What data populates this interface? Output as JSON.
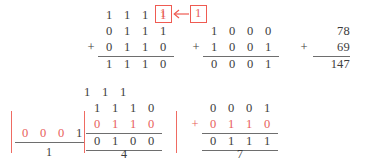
{
  "figure": {
    "colors": {
      "ink": "#3c3c3c",
      "accent_red": "#e8605a",
      "box_red": "#ef5b52",
      "rule": "#6e6e6e"
    }
  },
  "top": {
    "binary_left": {
      "carry_row": [
        "1",
        "1",
        "1",
        "1"
      ],
      "addend_top": [
        "0",
        "1",
        "1",
        "1"
      ],
      "addend_bottom": [
        "0",
        "1",
        "1",
        "0"
      ],
      "plus_sign": "+",
      "sum": [
        "1",
        "1",
        "1",
        "0"
      ]
    },
    "carry_out_box": "1",
    "carry_in_box": "1",
    "arrow": "←",
    "binary_right": {
      "addend_top": [
        "1",
        "0",
        "0",
        "0"
      ],
      "addend_bottom": [
        "1",
        "0",
        "0",
        "1"
      ],
      "plus_sign": "+",
      "sum": [
        "0",
        "0",
        "0",
        "1"
      ]
    },
    "decimal": {
      "addend_top": "78",
      "addend_bottom": "69",
      "plus_sign": "+",
      "sum": "147"
    }
  },
  "bottom": {
    "panel_left": {
      "digits": [
        "0",
        "0",
        "0",
        "1"
      ],
      "digit_colors": [
        "red",
        "red",
        "red",
        "black"
      ],
      "caption": "1"
    },
    "panel_middle": {
      "carry_row": [
        "1",
        "1",
        "1"
      ],
      "addend_top": [
        "1",
        "1",
        "1",
        "0"
      ],
      "addend_bottom": [
        "0",
        "1",
        "1",
        "0"
      ],
      "sum": [
        "0",
        "1",
        "0",
        "0"
      ],
      "caption": "4"
    },
    "panel_right": {
      "addend_top": [
        "0",
        "0",
        "0",
        "1"
      ],
      "plus_sign": "+",
      "addend_bottom": [
        "0",
        "1",
        "1",
        "0"
      ],
      "sum": [
        "0",
        "1",
        "1",
        "1"
      ],
      "caption": "7"
    }
  }
}
